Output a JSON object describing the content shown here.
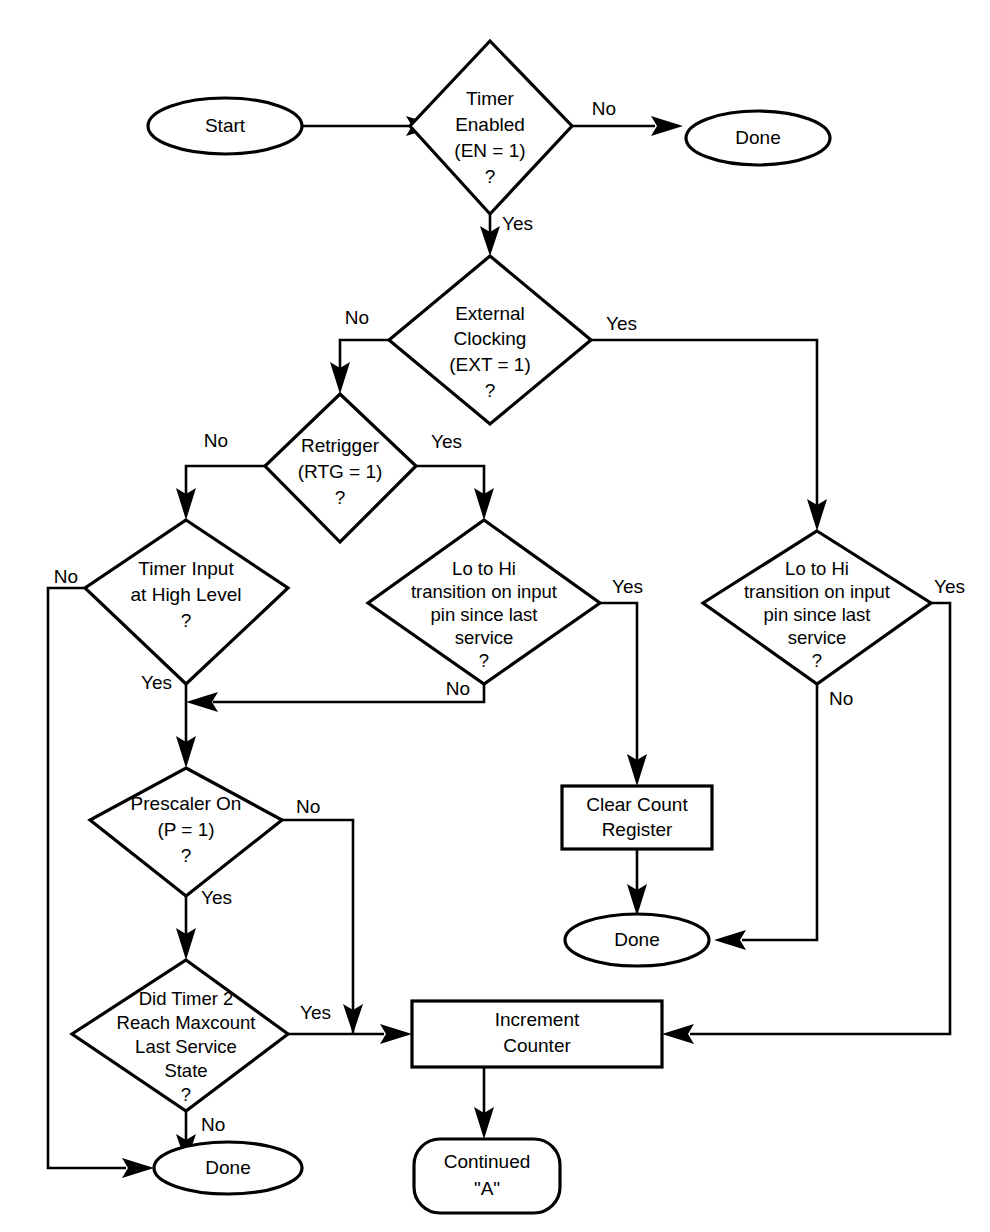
{
  "diagram": {
    "stroke_color": "#000000",
    "background_color": "#ffffff"
  },
  "nodes": {
    "start": {
      "label": "Start",
      "shape": "ellipse"
    },
    "timer_enabled": {
      "line1": "Timer",
      "line2": "Enabled",
      "line3": "(EN = 1)",
      "line4": "?",
      "shape": "diamond"
    },
    "done_top": {
      "label": "Done",
      "shape": "ellipse"
    },
    "external_clocking": {
      "line1": "External",
      "line2": "Clocking",
      "line3": "(EXT = 1)",
      "line4": "?",
      "shape": "diamond"
    },
    "retrigger": {
      "line1": "Retrigger",
      "line2": "(RTG = 1)",
      "line3": "?",
      "shape": "diamond"
    },
    "timer_input_high": {
      "line1": "Timer Input",
      "line2": "at High Level",
      "line3": "?",
      "shape": "diamond"
    },
    "lo_to_hi_mid": {
      "line1": "Lo to Hi",
      "line2": "transition on input",
      "line3": "pin since last",
      "line4": "service",
      "line5": "?",
      "shape": "diamond"
    },
    "lo_to_hi_right": {
      "line1": "Lo to Hi",
      "line2": "transition on input",
      "line3": "pin since last",
      "line4": "service",
      "line5": "?",
      "shape": "diamond"
    },
    "clear_count_register": {
      "line1": "Clear Count",
      "line2": "Register",
      "shape": "rect"
    },
    "done_right": {
      "label": "Done",
      "shape": "ellipse"
    },
    "prescaler_on": {
      "line1": "Prescaler On",
      "line2": "(P = 1)",
      "line3": "?",
      "shape": "diamond"
    },
    "did_timer2_maxcount": {
      "line1": "Did Timer 2",
      "line2": "Reach Maxcount",
      "line3": "Last Service",
      "line4": "State",
      "line5": "?",
      "shape": "diamond"
    },
    "increment_counter": {
      "line1": "Increment",
      "line2": "Counter",
      "shape": "rect"
    },
    "done_bottom": {
      "label": "Done",
      "shape": "ellipse"
    },
    "continued_a": {
      "line1": "Continued",
      "line2": "\"A\"",
      "shape": "rounded-rect"
    }
  },
  "edge_labels": {
    "timer_enabled_no": "No",
    "timer_enabled_yes": "Yes",
    "external_clocking_no": "No",
    "external_clocking_yes": "Yes",
    "retrigger_no": "No",
    "retrigger_yes": "Yes",
    "timer_input_no": "No",
    "timer_input_yes": "Yes",
    "lo_to_hi_mid_yes": "Yes",
    "lo_to_hi_mid_no": "No",
    "lo_to_hi_right_yes": "Yes",
    "lo_to_hi_right_no": "No",
    "prescaler_no": "No",
    "prescaler_yes": "Yes",
    "maxcount_yes": "Yes",
    "maxcount_no": "No"
  }
}
